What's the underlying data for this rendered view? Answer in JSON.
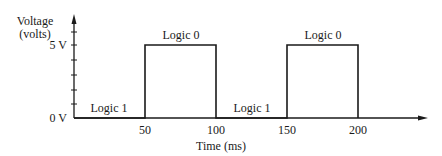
{
  "diagram": {
    "y_axis": {
      "label_line1": "Voltage",
      "label_line2": "(volts)",
      "tick_labels": [
        "5 V",
        "0 V"
      ]
    },
    "x_axis": {
      "label": "Time (ms)",
      "tick_labels": [
        "50",
        "100",
        "150",
        "200"
      ]
    },
    "segments": [
      {
        "label": "Logic 1",
        "level": "0 V",
        "from": 0,
        "to": 50
      },
      {
        "label": "Logic 0",
        "level": "5 V",
        "from": 50,
        "to": 100
      },
      {
        "label": "Logic 1",
        "level": "0 V",
        "from": 100,
        "to": 150
      },
      {
        "label": "Logic 0",
        "level": "5 V",
        "from": 150,
        "to": 200
      }
    ],
    "colors": {
      "line": "#1a1a1a",
      "background": "#ffffff"
    }
  }
}
